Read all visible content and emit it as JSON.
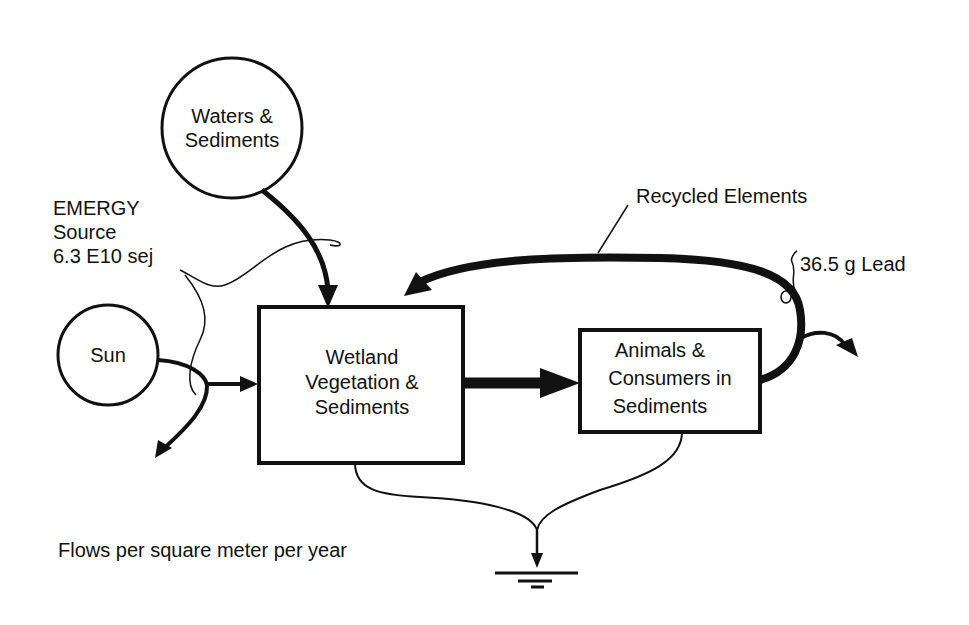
{
  "nodes": {
    "waters": {
      "label_line1": "Waters &",
      "label_line2": "Sediments"
    },
    "sun": {
      "label": "Sun"
    },
    "wetland": {
      "label_line1": "Wetland",
      "label_line2": "Vegetation &",
      "label_line3": "Sediments"
    },
    "animals": {
      "label_line1": "Animals &",
      "label_line2": "Consumers in",
      "label_line3": "Sediments"
    }
  },
  "annotations": {
    "emergy_line1": "EMERGY",
    "emergy_line2": "Source",
    "emergy_line3": "6.3 E10 sej",
    "recycled": "Recycled Elements",
    "lead": "36.5 g Lead",
    "caption": "Flows per square meter per year"
  },
  "colors": {
    "ink": "#111111",
    "background": "#ffffff"
  }
}
